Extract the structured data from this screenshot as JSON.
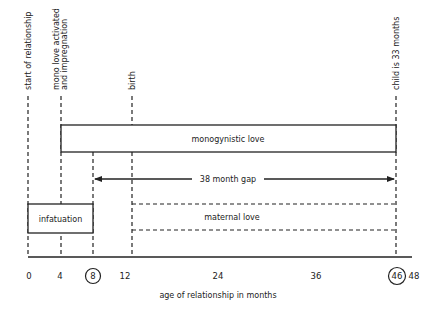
{
  "diagram": {
    "x_axis_label": "age of relationship in months",
    "tick_labels": [
      "0",
      "4",
      "8",
      "12",
      "24",
      "36",
      "46",
      "48"
    ],
    "circled_ticks": [
      "8",
      "46"
    ],
    "milestones": [
      {
        "month": "0",
        "label": "start of relationship"
      },
      {
        "month": "4",
        "label_line1": "mono love activated",
        "label_line2": "and impregnation"
      },
      {
        "month": "12",
        "label": "birth"
      },
      {
        "month": "46",
        "label": "child is 33 months"
      }
    ],
    "bars": {
      "monogynistic": {
        "label": "monogynistic love",
        "from": "4",
        "to": "46",
        "style": "solid"
      },
      "infatuation": {
        "label": "infatuation",
        "from": "0",
        "to": "8",
        "style": "solid"
      },
      "maternal": {
        "label": "maternal love",
        "from": "12",
        "to": "46",
        "style": "dashed"
      }
    },
    "gap_arrow": {
      "label": "38 month gap",
      "from": "8",
      "to": "46"
    },
    "colors": {
      "ink": "#222222",
      "background": "#ffffff"
    }
  }
}
